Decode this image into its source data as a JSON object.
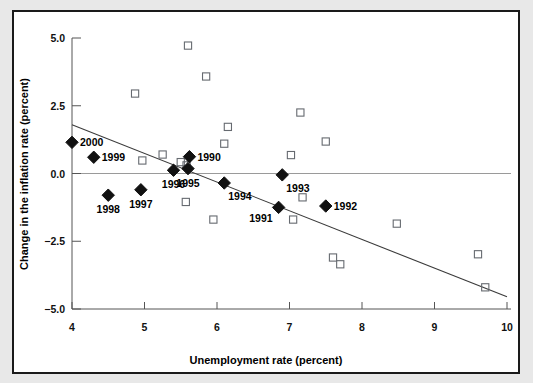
{
  "figure": {
    "background_color": "#e8e8e8",
    "panel_color": "#ffffff",
    "panel_border_color": "#1a1a1a"
  },
  "axes": {
    "x_title": "Unemployment rate (percent)",
    "y_title": "Change in the inflation rate (percent)",
    "x_ticks": [
      "4",
      "5",
      "6",
      "7",
      "8",
      "9",
      "10"
    ],
    "y_ticks": [
      "5.0",
      "2.5",
      "0.0",
      "−2.5",
      "−5.0"
    ]
  },
  "chart_data": {
    "type": "scatter",
    "title": "",
    "xlabel": "Unemployment rate (percent)",
    "ylabel": "Change in the inflation rate (percent)",
    "xlim": [
      4,
      10
    ],
    "ylim": [
      -5.0,
      5.0
    ],
    "xticks": [
      4,
      5,
      6,
      7,
      8,
      9,
      10
    ],
    "yticks": [
      5.0,
      2.5,
      0.0,
      -2.5,
      -5.0
    ],
    "grid": false,
    "legend": "none",
    "zero_reference_line": 0.0,
    "series": [
      {
        "name": "Labeled years (1990-2000)",
        "marker": "filled-diamond",
        "marker_color": "#111111",
        "points": [
          {
            "label": "2000",
            "x": 4.0,
            "y": 1.15,
            "label_pos": "right"
          },
          {
            "label": "1999",
            "x": 4.3,
            "y": 0.6,
            "label_pos": "right"
          },
          {
            "label": "1998",
            "x": 4.5,
            "y": -0.8,
            "label_pos": "below"
          },
          {
            "label": "1997",
            "x": 4.95,
            "y": -0.6,
            "label_pos": "below"
          },
          {
            "label": "1996",
            "x": 5.4,
            "y": 0.12,
            "label_pos": "below"
          },
          {
            "label": "1995",
            "x": 5.6,
            "y": 0.18,
            "label_pos": "below"
          },
          {
            "label": "1990",
            "x": 5.62,
            "y": 0.62,
            "label_pos": "right"
          },
          {
            "label": "1994",
            "x": 6.1,
            "y": -0.35,
            "label_pos": "below-right"
          },
          {
            "label": "1993",
            "x": 6.9,
            "y": -0.05,
            "label_pos": "below-right"
          },
          {
            "label": "1991",
            "x": 6.85,
            "y": -1.25,
            "label_pos": "below-left"
          },
          {
            "label": "1992",
            "x": 7.5,
            "y": -1.2,
            "label_pos": "right"
          }
        ]
      },
      {
        "name": "Other years",
        "marker": "open-square",
        "marker_color": "#666a70",
        "points": [
          {
            "x": 4.87,
            "y": 2.95
          },
          {
            "x": 4.97,
            "y": 0.48
          },
          {
            "x": 5.25,
            "y": 0.7
          },
          {
            "x": 5.5,
            "y": 0.42
          },
          {
            "x": 5.58,
            "y": 0.3
          },
          {
            "x": 5.6,
            "y": 4.72
          },
          {
            "x": 5.57,
            "y": -1.05
          },
          {
            "x": 5.85,
            "y": 3.58
          },
          {
            "x": 5.95,
            "y": -1.7
          },
          {
            "x": 6.1,
            "y": 1.1
          },
          {
            "x": 6.15,
            "y": 1.72
          },
          {
            "x": 7.02,
            "y": 0.68
          },
          {
            "x": 7.05,
            "y": -1.7
          },
          {
            "x": 7.15,
            "y": 2.25
          },
          {
            "x": 7.18,
            "y": -0.88
          },
          {
            "x": 7.5,
            "y": 1.18
          },
          {
            "x": 7.6,
            "y": -3.1
          },
          {
            "x": 7.7,
            "y": -3.35
          },
          {
            "x": 8.48,
            "y": -1.85
          },
          {
            "x": 9.6,
            "y": -2.98
          },
          {
            "x": 9.7,
            "y": -4.2
          }
        ]
      }
    ],
    "trend_line": {
      "name": "fitted regression line",
      "x_start": 4.0,
      "y_start": 1.8,
      "x_end": 10.0,
      "y_end": -4.55,
      "color": "#3b3b3b"
    }
  }
}
